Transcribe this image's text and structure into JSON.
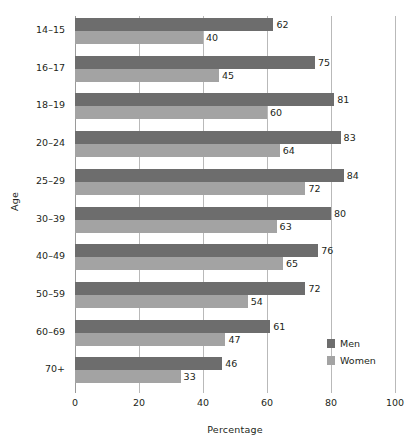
{
  "chart_data": {
    "type": "bar",
    "orientation": "horizontal",
    "title": "",
    "xlabel": "Percentage",
    "ylabel": "Age",
    "xlim": [
      0,
      100
    ],
    "xticks": [
      0,
      20,
      40,
      60,
      80,
      100
    ],
    "grid": true,
    "legend_position": "right-lower",
    "categories": [
      "14–15",
      "16–17",
      "18–19",
      "20–24",
      "25–29",
      "30–39",
      "40–49",
      "50–59",
      "60–69",
      "70+"
    ],
    "series": [
      {
        "name": "Men",
        "color": "#6d6d6d",
        "values": [
          62,
          75,
          81,
          83,
          84,
          80,
          76,
          72,
          61,
          46
        ]
      },
      {
        "name": "Women",
        "color": "#a3a3a3",
        "values": [
          40,
          45,
          60,
          64,
          72,
          63,
          65,
          54,
          47,
          33
        ]
      }
    ]
  },
  "axes": {
    "y_title": "Age",
    "x_title": "Percentage",
    "x_tick_labels": [
      "0",
      "20",
      "40",
      "60",
      "80",
      "100"
    ],
    "y_tick_labels": [
      "14–15",
      "16–17",
      "18–19",
      "20–24",
      "25–29",
      "30–39",
      "40–49",
      "50–59",
      "60–69",
      "70+"
    ]
  },
  "legend": {
    "items": [
      {
        "label": "Men",
        "color": "#6d6d6d"
      },
      {
        "label": "Women",
        "color": "#a3a3a3"
      }
    ]
  },
  "colors": {
    "men": "#6d6d6d",
    "women": "#a3a3a3",
    "gridline": "#b9b9b9",
    "text": "#231f20",
    "background": "#ffffff"
  }
}
